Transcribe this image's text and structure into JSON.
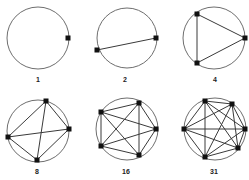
{
  "figure": {
    "colors": {
      "circle": "#6e6e6e",
      "edge": "#3a3a3a",
      "vertex": "#111111",
      "label": "#222222"
    },
    "panels": [
      {
        "label": "1",
        "circle": {
          "cx": 38,
          "cy": 38,
          "r": 31
        },
        "label_pos": {
          "x": 38,
          "y": 82
        },
        "points": [
          [
            68,
            38
          ]
        ],
        "edges": []
      },
      {
        "label": "2",
        "circle": {
          "cx": 127,
          "cy": 38,
          "r": 30
        },
        "label_pos": {
          "x": 125,
          "y": 82
        },
        "points": [
          [
            97,
            50
          ],
          [
            156,
            38
          ]
        ],
        "edges": [
          [
            0,
            1
          ]
        ]
      },
      {
        "label": "4",
        "circle": {
          "cx": 214,
          "cy": 38,
          "r": 31
        },
        "label_pos": {
          "x": 215,
          "y": 82
        },
        "points": [
          [
            197,
            14
          ],
          [
            245,
            38
          ],
          [
            197,
            63
          ]
        ],
        "edges": [
          [
            0,
            1
          ],
          [
            1,
            2
          ],
          [
            2,
            0
          ]
        ]
      },
      {
        "label": "8",
        "circle": {
          "cx": 38,
          "cy": 131,
          "r": 31
        },
        "label_pos": {
          "x": 37,
          "y": 174
        },
        "points": [
          [
            46,
            101
          ],
          [
            69,
            129
          ],
          [
            37,
            160
          ],
          [
            8,
            137
          ]
        ],
        "edges": [
          [
            0,
            1
          ],
          [
            1,
            2
          ],
          [
            2,
            3
          ],
          [
            3,
            0
          ],
          [
            0,
            2
          ],
          [
            1,
            3
          ]
        ]
      },
      {
        "label": "16",
        "circle": {
          "cx": 127,
          "cy": 129,
          "r": 31
        },
        "label_pos": {
          "x": 126,
          "y": 174
        },
        "points": [
          [
            101,
            112
          ],
          [
            139,
            103
          ],
          [
            156,
            129
          ],
          [
            139,
            155
          ],
          [
            101,
            146
          ]
        ],
        "edges": [
          [
            0,
            1
          ],
          [
            0,
            2
          ],
          [
            0,
            3
          ],
          [
            0,
            4
          ],
          [
            1,
            2
          ],
          [
            1,
            3
          ],
          [
            1,
            4
          ],
          [
            2,
            3
          ],
          [
            2,
            4
          ],
          [
            3,
            4
          ]
        ]
      },
      {
        "label": "31",
        "circle": {
          "cx": 215,
          "cy": 129,
          "r": 31
        },
        "label_pos": {
          "x": 214,
          "y": 174
        },
        "points": [
          [
            205,
            101
          ],
          [
            232,
            104
          ],
          [
            245,
            129
          ],
          [
            238,
            148
          ],
          [
            205,
            157
          ],
          [
            184,
            129
          ]
        ],
        "edges": [
          [
            0,
            1
          ],
          [
            0,
            2
          ],
          [
            0,
            3
          ],
          [
            0,
            4
          ],
          [
            0,
            5
          ],
          [
            1,
            2
          ],
          [
            1,
            3
          ],
          [
            1,
            4
          ],
          [
            1,
            5
          ],
          [
            2,
            3
          ],
          [
            2,
            4
          ],
          [
            2,
            5
          ],
          [
            3,
            4
          ],
          [
            3,
            5
          ],
          [
            4,
            5
          ]
        ]
      }
    ]
  }
}
